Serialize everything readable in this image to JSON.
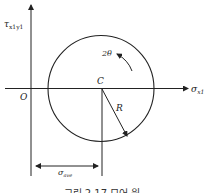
{
  "diagram": {
    "type": "mohr-circle",
    "axes": {
      "y_label_main": "τ",
      "y_label_sub": "x1y1",
      "x_label_main": "σ",
      "x_label_sub": "x1",
      "origin_label": "O"
    },
    "circle": {
      "center_label": "C",
      "radius_label": "R",
      "angle_label": "2θ"
    },
    "dimension": {
      "label_main": "σ",
      "label_sub": "ave"
    },
    "caption": "그림 2.17 모어 원"
  },
  "colors": {
    "stroke": "#222222",
    "background": "#ffffff"
  }
}
